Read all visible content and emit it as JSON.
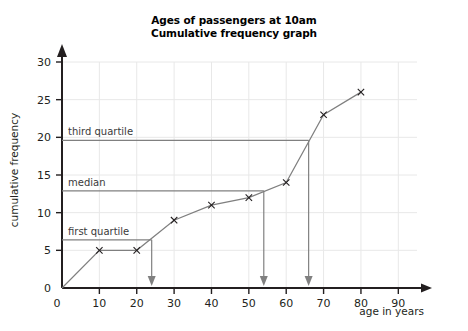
{
  "chart_data": {
    "type": "line",
    "title": "Ages of passengers at 10am",
    "subtitle": "Cumulative frequency graph",
    "xlabel": "age in years",
    "ylabel": "cumulative frequency",
    "xlim": [
      0,
      95
    ],
    "ylim": [
      0,
      31
    ],
    "xticks": [
      0,
      10,
      20,
      30,
      40,
      50,
      60,
      70,
      80,
      90
    ],
    "yticks": [
      0,
      5,
      10,
      15,
      20,
      25,
      30
    ],
    "xtick_labels": [
      "0",
      "10",
      "20",
      "30",
      "40",
      "50",
      "60",
      "70",
      "80",
      "90"
    ],
    "ytick_labels": [
      "0",
      "5",
      "10",
      "15",
      "20",
      "25",
      "30"
    ],
    "grid": true,
    "legend": "none",
    "marker": "x",
    "x": [
      0,
      10,
      20,
      30,
      40,
      50,
      60,
      70,
      80
    ],
    "values": [
      0,
      5,
      5,
      9,
      11,
      12,
      14,
      23,
      26
    ],
    "points": [
      {
        "x": 0,
        "y": 0,
        "marker": false
      },
      {
        "x": 10,
        "y": 5,
        "marker": true
      },
      {
        "x": 20,
        "y": 5,
        "marker": true
      },
      {
        "x": 30,
        "y": 9,
        "marker": true
      },
      {
        "x": 40,
        "y": 11,
        "marker": true
      },
      {
        "x": 50,
        "y": 12,
        "marker": true
      },
      {
        "x": 60,
        "y": 14,
        "marker": true
      },
      {
        "x": 70,
        "y": 23,
        "marker": true
      },
      {
        "x": 80,
        "y": 26,
        "marker": true
      }
    ],
    "annotations": [
      {
        "name": "first-quartile",
        "label": "first quartile",
        "cf": 6.4,
        "age": 24
      },
      {
        "name": "median",
        "label": "median",
        "cf": 12.9,
        "age": 54
      },
      {
        "name": "third-quartile",
        "label": "third quartile",
        "cf": 19.6,
        "age": 66
      }
    ],
    "colors": {
      "background": "#ffffff",
      "axis": "#231f20",
      "grid": "#e8e8e8",
      "series": "#7f7f7f",
      "annotation": "#808080",
      "marker": "#231f20",
      "text": "#231f20"
    }
  }
}
